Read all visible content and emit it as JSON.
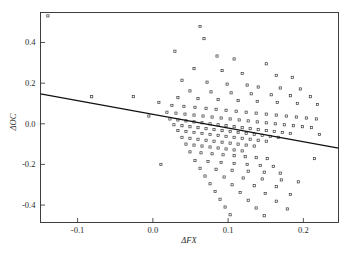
{
  "chart_data": {
    "type": "scatter",
    "title": "",
    "subtitle": "",
    "xlabel": "ΔFX",
    "ylabel": "ΔOC",
    "xlim": [
      -0.1493,
      0.2467
    ],
    "ylim": [
      -0.4857,
      0.5476
    ],
    "xticks": [
      -0.1,
      0.0,
      0.1,
      0.2
    ],
    "xtick_labels": [
      "-0.1",
      "0.0",
      "0.1",
      "0.2"
    ],
    "yticks": [
      0.4,
      0.2,
      0.0,
      -0.2,
      -0.4
    ],
    "ytick_labels": [
      "0.4",
      "0.2",
      "0.0",
      "-0.2",
      "-0.4"
    ],
    "grid": false,
    "legend": null,
    "marker_style": "open-square",
    "marker_color": "#3a3a3a",
    "fit_line": {
      "type": "linear-regression",
      "color": "#111111",
      "intercept": 0.0466,
      "slope": -0.6768,
      "x_start": -0.1493,
      "y_start": 0.1477,
      "x_end": 0.2467,
      "y_end": -0.1203
    },
    "n_points": 171,
    "points": [
      [
        -0.1395,
        0.531
      ],
      [
        -0.026,
        0.1333
      ],
      [
        0.0627,
        0.4786
      ],
      [
        0.068,
        0.419
      ],
      [
        0.0293,
        0.3571
      ],
      [
        0.0853,
        0.3333
      ],
      [
        0.108,
        0.319
      ],
      [
        0.1507,
        0.2952
      ],
      [
        0.0547,
        0.2714
      ],
      [
        0.092,
        0.2619
      ],
      [
        0.1187,
        0.2476
      ],
      [
        0.164,
        0.2381
      ],
      [
        0.1853,
        0.2286
      ],
      [
        0.0387,
        0.2143
      ],
      [
        0.072,
        0.2048
      ],
      [
        0.0987,
        0.1952
      ],
      [
        0.1253,
        0.1905
      ],
      [
        0.14,
        0.181
      ],
      [
        0.1693,
        0.1762
      ],
      [
        0.196,
        0.1714
      ],
      [
        0.0493,
        0.1619
      ],
      [
        0.0773,
        0.1571
      ],
      [
        0.104,
        0.1524
      ],
      [
        0.1307,
        0.1476
      ],
      [
        0.1573,
        0.1429
      ],
      [
        0.1827,
        0.1381
      ],
      [
        0.2093,
        0.1333
      ],
      [
        0.0333,
        0.1286
      ],
      [
        0.06,
        0.1238
      ],
      [
        0.0867,
        0.119
      ],
      [
        0.1133,
        0.1143
      ],
      [
        0.1387,
        0.1095
      ],
      [
        0.1653,
        0.1048
      ],
      [
        0.192,
        0.1
      ],
      [
        0.2187,
        0.0952
      ],
      [
        0.008,
        0.1048
      ],
      [
        0.0253,
        0.0905
      ],
      [
        0.0413,
        0.0857
      ],
      [
        0.056,
        0.081
      ],
      [
        0.0707,
        0.0762
      ],
      [
        0.084,
        0.0714
      ],
      [
        0.0973,
        0.0667
      ],
      [
        0.1107,
        0.0619
      ],
      [
        0.124,
        0.0571
      ],
      [
        0.1373,
        0.0524
      ],
      [
        0.1507,
        0.0476
      ],
      [
        0.164,
        0.0429
      ],
      [
        0.1773,
        0.0381
      ],
      [
        0.1907,
        0.0333
      ],
      [
        0.204,
        0.0286
      ],
      [
        0.2173,
        0.0238
      ],
      [
        0.0187,
        0.0571
      ],
      [
        0.0307,
        0.0524
      ],
      [
        0.0427,
        0.0476
      ],
      [
        0.0547,
        0.0429
      ],
      [
        0.0667,
        0.0381
      ],
      [
        0.0787,
        0.0333
      ],
      [
        0.0907,
        0.0286
      ],
      [
        0.1027,
        0.0238
      ],
      [
        0.1147,
        0.019
      ],
      [
        0.1267,
        0.0143
      ],
      [
        0.1387,
        0.0095
      ],
      [
        0.1507,
        0.0048
      ],
      [
        0.1627,
        0.0
      ],
      [
        0.1747,
        -0.0048
      ],
      [
        0.1867,
        -0.0095
      ],
      [
        0.1987,
        -0.0143
      ],
      [
        0.2107,
        -0.019
      ],
      [
        0.0227,
        0.0238
      ],
      [
        0.0333,
        0.019
      ],
      [
        0.044,
        0.0143
      ],
      [
        0.0547,
        0.0095
      ],
      [
        0.0653,
        0.0048
      ],
      [
        0.076,
        0.0
      ],
      [
        0.0867,
        -0.0048
      ],
      [
        0.0973,
        -0.0095
      ],
      [
        0.108,
        -0.0143
      ],
      [
        0.1187,
        -0.019
      ],
      [
        0.1293,
        -0.0238
      ],
      [
        0.14,
        -0.0286
      ],
      [
        0.1507,
        -0.0333
      ],
      [
        0.1613,
        -0.0381
      ],
      [
        0.172,
        -0.0429
      ],
      [
        0.1827,
        -0.0476
      ],
      [
        0.028,
        -0.0048
      ],
      [
        0.0387,
        -0.0095
      ],
      [
        0.0493,
        -0.0143
      ],
      [
        0.06,
        -0.019
      ],
      [
        0.0707,
        -0.0238
      ],
      [
        0.0813,
        -0.0286
      ],
      [
        0.092,
        -0.0333
      ],
      [
        0.1027,
        -0.0381
      ],
      [
        0.1133,
        -0.0429
      ],
      [
        0.124,
        -0.0476
      ],
      [
        0.1347,
        -0.0524
      ],
      [
        0.1453,
        -0.0571
      ],
      [
        0.156,
        -0.0619
      ],
      [
        0.1667,
        -0.0667
      ],
      [
        0.0333,
        -0.0333
      ],
      [
        0.044,
        -0.0381
      ],
      [
        0.0547,
        -0.0429
      ],
      [
        0.0653,
        -0.0476
      ],
      [
        0.076,
        -0.0524
      ],
      [
        0.0867,
        -0.0571
      ],
      [
        0.0973,
        -0.0619
      ],
      [
        0.108,
        -0.0667
      ],
      [
        0.1187,
        -0.0714
      ],
      [
        0.1293,
        -0.0762
      ],
      [
        0.14,
        -0.081
      ],
      [
        0.1507,
        -0.0857
      ],
      [
        0.0387,
        -0.0667
      ],
      [
        0.0493,
        -0.0714
      ],
      [
        0.06,
        -0.0762
      ],
      [
        0.0707,
        -0.081
      ],
      [
        0.0813,
        -0.0857
      ],
      [
        0.092,
        -0.0905
      ],
      [
        0.1027,
        -0.0952
      ],
      [
        0.1133,
        -0.1
      ],
      [
        0.124,
        -0.1048
      ],
      [
        0.1347,
        -0.1095
      ],
      [
        0.044,
        -0.1
      ],
      [
        0.0547,
        -0.1048
      ],
      [
        0.0653,
        -0.1095
      ],
      [
        0.076,
        -0.1143
      ],
      [
        0.0867,
        -0.119
      ],
      [
        0.0973,
        -0.1238
      ],
      [
        0.108,
        -0.1286
      ],
      [
        0.1187,
        -0.1333
      ],
      [
        0.0493,
        -0.1381
      ],
      [
        0.064,
        -0.1429
      ],
      [
        0.0787,
        -0.1476
      ],
      [
        0.0933,
        -0.1524
      ],
      [
        0.108,
        -0.1571
      ],
      [
        0.1227,
        -0.1619
      ],
      [
        0.1373,
        -0.1667
      ],
      [
        0.152,
        -0.1714
      ],
      [
        0.056,
        -0.181
      ],
      [
        0.0733,
        -0.1857
      ],
      [
        0.0907,
        -0.1905
      ],
      [
        0.108,
        -0.1952
      ],
      [
        0.1253,
        -0.2
      ],
      [
        0.1427,
        -0.2048
      ],
      [
        0.16,
        -0.2095
      ],
      [
        0.0627,
        -0.219
      ],
      [
        0.084,
        -0.2238
      ],
      [
        0.1053,
        -0.2286
      ],
      [
        0.1267,
        -0.2333
      ],
      [
        0.148,
        -0.2381
      ],
      [
        0.1693,
        -0.2429
      ],
      [
        0.0693,
        -0.2571
      ],
      [
        0.0947,
        -0.2619
      ],
      [
        0.12,
        -0.2667
      ],
      [
        0.1453,
        -0.2714
      ],
      [
        0.1707,
        -0.2762
      ],
      [
        0.076,
        -0.2952
      ],
      [
        0.1053,
        -0.3
      ],
      [
        0.1347,
        -0.3048
      ],
      [
        0.164,
        -0.3095
      ],
      [
        0.0827,
        -0.3333
      ],
      [
        0.116,
        -0.3381
      ],
      [
        0.1493,
        -0.3429
      ],
      [
        0.1827,
        -0.3476
      ],
      [
        0.0893,
        -0.3714
      ],
      [
        0.1267,
        -0.3762
      ],
      [
        0.164,
        -0.381
      ],
      [
        0.096,
        -0.4095
      ],
      [
        0.1373,
        -0.4143
      ],
      [
        0.1787,
        -0.419
      ],
      [
        0.1027,
        -0.4476
      ],
      [
        0.148,
        -0.4524
      ],
      [
        0.2147,
        -0.1714
      ],
      [
        0.2213,
        -0.0524
      ],
      [
        0.1933,
        -0.2857
      ],
      [
        -0.0813,
        0.1333
      ],
      [
        -0.0053,
        0.0381
      ],
      [
        0.0107,
        -0.2
      ]
    ]
  }
}
